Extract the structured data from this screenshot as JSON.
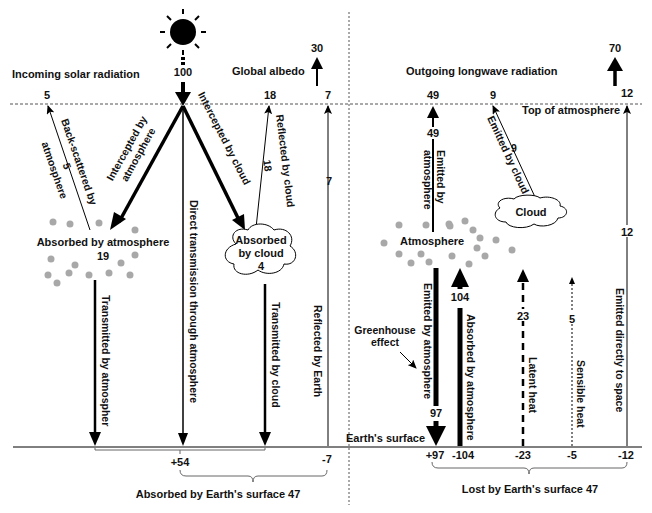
{
  "incoming": {
    "heading": "Incoming solar radiation",
    "solar_input": "100",
    "global_albedo_label": "Global albedo",
    "global_albedo_value": "30",
    "top_backscatter": "5",
    "top_reflected_cloud": "18",
    "top_reflected_earth": "7",
    "backscatter_label_line1": "Back-scattered by",
    "backscatter_label_line2": "atmosphere",
    "backscatter_value": "5",
    "intercepted_atm_line1": "Intercepted by",
    "intercepted_atm_line2": "atmosphere",
    "intercepted_cloud": "Intercepted by cloud",
    "reflected_cloud_label": "Reflected by cloud",
    "reflected_cloud_value": "18",
    "reflected_earth_label": "Reflected by Earth",
    "reflected_earth_value": "7",
    "absorbed_atm_label": "Absorbed by atmosphere",
    "absorbed_atm_value": "19",
    "absorbed_cloud_line1": "Absorbed",
    "absorbed_cloud_line2": "by cloud",
    "absorbed_cloud_value": "4",
    "direct_transmission": "Direct transmission through atmosphere",
    "transmitted_atm": "Transmitted by atmospher",
    "transmitted_cloud": "Transmitted by cloud",
    "surface_plus": "+54",
    "surface_minus": "-7",
    "absorbed_surface": "Absorbed by Earth's surface 47"
  },
  "outgoing": {
    "heading": "Outgoing longwave radiation",
    "total_value": "70",
    "top_atm": "49",
    "top_cloud": "9",
    "top_direct": "12",
    "top_of_atmosphere": "Top of atmosphere",
    "emitted_atm_value": "49",
    "emitted_atm_line1": "Emitted by",
    "emitted_atm_line2": "atmosphere",
    "emitted_cloud_label": "Emitted by cloud",
    "emitted_cloud_value": "9",
    "cloud_label": "Cloud",
    "atmosphere_label": "Atmosphere",
    "direct_space_label": "Emitted directly to space",
    "direct_space_value": "12",
    "greenhouse_line1": "Greenhouse",
    "greenhouse_line2": "effect",
    "back_emitted_label": "Emitted by atmosphere",
    "back_emitted_value": "97",
    "absorbed_by_atm_label": "Absorbed by atmosphere",
    "absorbed_by_atm_value": "104",
    "latent_label": "Latent heat",
    "latent_value": "23",
    "sensible_label": "Sensible heat",
    "sensible_value": "5",
    "earth_surface": "Earth's surface",
    "surface_values": [
      "+97",
      "-104",
      "-23",
      "-5",
      "-12"
    ],
    "lost_surface": "Lost by Earth's surface 47"
  }
}
